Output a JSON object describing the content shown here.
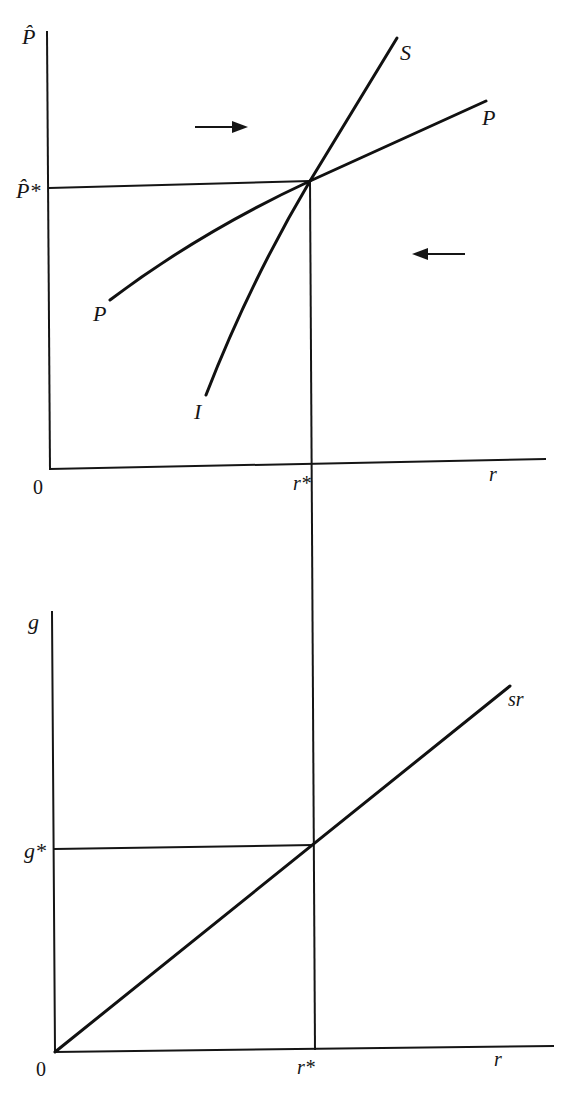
{
  "figure": {
    "top_panel": {
      "y_axis_label": "P̂",
      "x_axis_label": "r",
      "origin_label": "0",
      "equilibrium_y_label": "P̂*",
      "equilibrium_x_label": "r*",
      "curves": [
        {
          "id": "S",
          "label": "S"
        },
        {
          "id": "P_upper",
          "label": "P"
        },
        {
          "id": "P_lower",
          "label": "P"
        },
        {
          "id": "I",
          "label": "I"
        }
      ],
      "arrows": [
        {
          "direction": "right",
          "position": "upper-left of equilibrium"
        },
        {
          "direction": "left",
          "position": "lower-right of equilibrium"
        }
      ]
    },
    "bottom_panel": {
      "y_axis_label": "g",
      "x_axis_label": "r",
      "origin_label": "0",
      "equilibrium_y_label": "g*",
      "equilibrium_x_label": "r*",
      "curves": [
        {
          "id": "sr",
          "label": "sr"
        }
      ]
    },
    "colors": {
      "ink": "#151515",
      "background": "#ffffff"
    }
  }
}
